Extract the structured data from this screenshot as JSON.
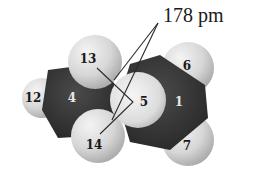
{
  "figure": {
    "annotation": "178 pm",
    "atom_labels": {
      "h12": "12",
      "c4": "4",
      "h13": "13",
      "h14": "14",
      "x5": "5",
      "c1": "1",
      "h6": "6",
      "h7": "7"
    },
    "colors": {
      "hydrogen": "#d9d9d9",
      "carbon": "#3a3a3a",
      "center_atom": "#e8e8e8",
      "leader_lines": "#2a2a2a",
      "text": "#1a1a1a"
    }
  }
}
